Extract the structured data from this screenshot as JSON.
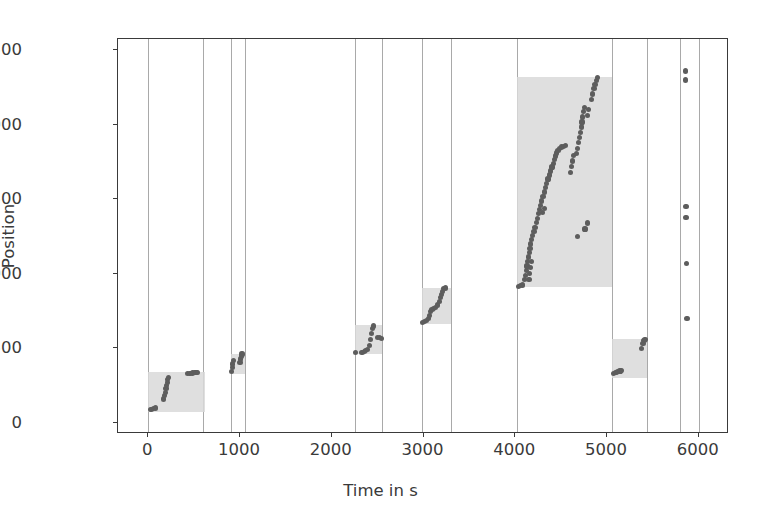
{
  "chart_data": {
    "type": "scatter",
    "title": "",
    "xlabel": "Time in s",
    "ylabel": "Position",
    "xlim": [
      -330,
      6330
    ],
    "ylim": [
      -75,
      2575
    ],
    "xticks": [
      0,
      1000,
      2000,
      3000,
      4000,
      5000,
      6000
    ],
    "xticklabels": [
      "0",
      "1000",
      "2000",
      "3000",
      "4000",
      "5000",
      "6000"
    ],
    "yticks": [
      0,
      500,
      1000,
      1500,
      2000,
      2500
    ],
    "yticklabels": [
      "0",
      "500",
      "1000",
      "1500",
      "2000",
      "2500"
    ],
    "grid": "vertical-only",
    "legend": "none",
    "colors": {
      "point": "#5d5d5d",
      "band": "#d9d9d9",
      "grid": "#9a9a9a",
      "axis": "#3a3a3a",
      "background": "#ffffff"
    },
    "vertical_gridlines_x": [
      0,
      600,
      900,
      1050,
      2250,
      2550,
      2980,
      3300,
      4020,
      5060,
      5440,
      5800,
      6000
    ],
    "shaded_bands": [
      {
        "name": "band-1",
        "x0": 0,
        "x1": 620,
        "y0": 75,
        "y1": 340
      },
      {
        "name": "band-2",
        "x0": 900,
        "x1": 1050,
        "y0": 330,
        "y1": 460
      },
      {
        "name": "band-3",
        "x0": 2250,
        "x1": 2550,
        "y0": 460,
        "y1": 655
      },
      {
        "name": "band-4",
        "x0": 2980,
        "x1": 3300,
        "y0": 660,
        "y1": 905
      },
      {
        "name": "band-5",
        "x0": 4020,
        "x1": 5060,
        "y0": 910,
        "y1": 2320
      },
      {
        "name": "band-6",
        "x0": 5060,
        "x1": 5440,
        "y0": 300,
        "y1": 560
      }
    ],
    "series": [
      {
        "name": "position-track",
        "marker": "circle",
        "points": [
          [
            30,
            90
          ],
          [
            55,
            95
          ],
          [
            75,
            100
          ],
          [
            170,
            160
          ],
          [
            178,
            182
          ],
          [
            186,
            205
          ],
          [
            194,
            228
          ],
          [
            200,
            250
          ],
          [
            208,
            272
          ],
          [
            214,
            292
          ],
          [
            222,
            305
          ],
          [
            430,
            330
          ],
          [
            455,
            333
          ],
          [
            478,
            334
          ],
          [
            500,
            335
          ],
          [
            520,
            336
          ],
          [
            540,
            337
          ],
          [
            905,
            345
          ],
          [
            915,
            372
          ],
          [
            922,
            395
          ],
          [
            930,
            418
          ],
          [
            1000,
            405
          ],
          [
            1008,
            428
          ],
          [
            1016,
            448
          ],
          [
            1022,
            462
          ],
          [
            2260,
            470
          ],
          [
            2330,
            470
          ],
          [
            2355,
            478
          ],
          [
            2372,
            483
          ],
          [
            2392,
            490
          ],
          [
            2412,
            520
          ],
          [
            2425,
            560
          ],
          [
            2437,
            600
          ],
          [
            2448,
            632
          ],
          [
            2455,
            650
          ],
          [
            2500,
            575
          ],
          [
            2520,
            570
          ],
          [
            2540,
            565
          ],
          [
            2990,
            672
          ],
          [
            3010,
            678
          ],
          [
            3030,
            685
          ],
          [
            3055,
            700
          ],
          [
            3068,
            722
          ],
          [
            3080,
            745
          ],
          [
            3092,
            762
          ],
          [
            3110,
            765
          ],
          [
            3130,
            772
          ],
          [
            3150,
            790
          ],
          [
            3170,
            812
          ],
          [
            3182,
            838
          ],
          [
            3195,
            862
          ],
          [
            3208,
            882
          ],
          [
            3220,
            900
          ],
          [
            3240,
            905
          ],
          [
            4035,
            915
          ],
          [
            4060,
            920
          ],
          [
            4080,
            925
          ],
          [
            4105,
            960
          ],
          [
            4112,
            990
          ],
          [
            4120,
            1020
          ],
          [
            4128,
            1052
          ],
          [
            4136,
            1082
          ],
          [
            4144,
            1112
          ],
          [
            4152,
            1142
          ],
          [
            4160,
            1172
          ],
          [
            4168,
            1200
          ],
          [
            4180,
            1228
          ],
          [
            4192,
            1256
          ],
          [
            4204,
            1282
          ],
          [
            4216,
            1310
          ],
          [
            4150,
            960
          ],
          [
            4158,
            1000
          ],
          [
            4168,
            1042
          ],
          [
            4178,
            1082
          ],
          [
            4228,
            1342
          ],
          [
            4240,
            1372
          ],
          [
            4252,
            1402
          ],
          [
            4264,
            1432
          ],
          [
            4276,
            1458
          ],
          [
            4290,
            1488
          ],
          [
            4302,
            1518
          ],
          [
            4316,
            1548
          ],
          [
            4330,
            1578
          ],
          [
            4344,
            1608
          ],
          [
            4358,
            1636
          ],
          [
            4372,
            1662
          ],
          [
            4300,
            1410
          ],
          [
            4318,
            1440
          ],
          [
            4386,
            1690
          ],
          [
            4400,
            1716
          ],
          [
            4414,
            1742
          ],
          [
            4428,
            1768
          ],
          [
            4440,
            1790
          ],
          [
            4452,
            1810
          ],
          [
            4466,
            1828
          ],
          [
            4480,
            1840
          ],
          [
            4508,
            1850
          ],
          [
            4526,
            1856
          ],
          [
            4544,
            1862
          ],
          [
            4600,
            1680
          ],
          [
            4612,
            1718
          ],
          [
            4624,
            1756
          ],
          [
            4636,
            1792
          ],
          [
            4664,
            1805
          ],
          [
            4676,
            1842
          ],
          [
            4688,
            1878
          ],
          [
            4704,
            1912
          ],
          [
            4712,
            1948
          ],
          [
            4720,
            1984
          ],
          [
            4728,
            2018
          ],
          [
            4736,
            2052
          ],
          [
            4744,
            2086
          ],
          [
            4752,
            2118
          ],
          [
            4790,
            2062
          ],
          [
            4800,
            2100
          ],
          [
            4834,
            2170
          ],
          [
            4846,
            2206
          ],
          [
            4858,
            2242
          ],
          [
            4870,
            2272
          ],
          [
            4882,
            2298
          ],
          [
            4894,
            2316
          ],
          [
            4760,
            1300
          ],
          [
            4790,
            1340
          ],
          [
            4680,
            1250
          ],
          [
            5072,
            330
          ],
          [
            5090,
            335
          ],
          [
            5105,
            340
          ],
          [
            5120,
            345
          ],
          [
            5142,
            348
          ],
          [
            5160,
            352
          ],
          [
            5380,
            500
          ],
          [
            5392,
            530
          ],
          [
            5404,
            552
          ],
          [
            5414,
            560
          ],
          [
            5855,
            2360
          ],
          [
            5855,
            2300
          ],
          [
            5862,
            1450
          ],
          [
            5862,
            1380
          ],
          [
            5868,
            1070
          ],
          [
            5872,
            700
          ]
        ]
      }
    ]
  },
  "axis_titles": {
    "x": "Time in s",
    "y": "Position"
  }
}
